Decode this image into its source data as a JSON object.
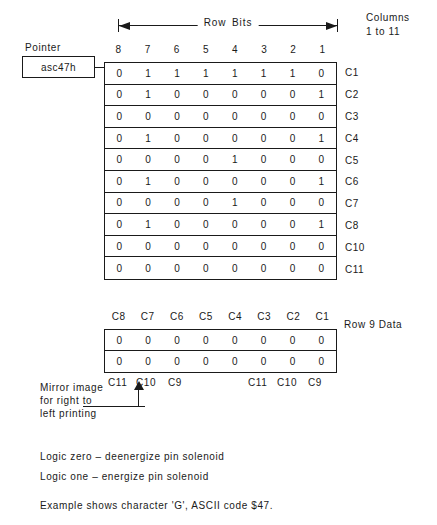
{
  "header": {
    "row_bits_label": "Row Bits",
    "columns_note_line1": "Columns",
    "columns_note_line2": "1  to  11"
  },
  "pointer": {
    "label": "Pointer",
    "value": "asc47h"
  },
  "main_table": {
    "column_headers": [
      "8",
      "7",
      "6",
      "5",
      "4",
      "3",
      "2",
      "1"
    ],
    "row_labels": [
      "C1",
      "C2",
      "C3",
      "C4",
      "C5",
      "C6",
      "C7",
      "C8",
      "C10",
      "C11"
    ],
    "rows": [
      [
        "0",
        "1",
        "1",
        "1",
        "1",
        "1",
        "1",
        "0"
      ],
      [
        "0",
        "1",
        "0",
        "0",
        "0",
        "0",
        "0",
        "1"
      ],
      [
        "0",
        "0",
        "0",
        "0",
        "0",
        "0",
        "0",
        "0"
      ],
      [
        "0",
        "1",
        "0",
        "0",
        "0",
        "0",
        "0",
        "1"
      ],
      [
        "0",
        "0",
        "0",
        "0",
        "1",
        "0",
        "0",
        "0"
      ],
      [
        "0",
        "1",
        "0",
        "0",
        "0",
        "0",
        "0",
        "1"
      ],
      [
        "0",
        "0",
        "0",
        "0",
        "1",
        "0",
        "0",
        "0"
      ],
      [
        "0",
        "1",
        "0",
        "0",
        "0",
        "0",
        "0",
        "1"
      ],
      [
        "0",
        "0",
        "0",
        "0",
        "0",
        "0",
        "0",
        "0"
      ],
      [
        "0",
        "0",
        "0",
        "0",
        "0",
        "0",
        "0",
        "0"
      ]
    ]
  },
  "row9_table": {
    "column_headers": [
      "C8",
      "C7",
      "C6",
      "C5",
      "C4",
      "C3",
      "C2",
      "C1"
    ],
    "rows": [
      [
        "0",
        "0",
        "0",
        "0",
        "0",
        "0",
        "0",
        "0"
      ],
      [
        "0",
        "0",
        "0",
        "0",
        "0",
        "0",
        "0",
        "0"
      ]
    ],
    "side_label": "Row  9  Data",
    "footer_left": [
      "C11",
      "C10",
      "C9"
    ],
    "footer_right": [
      "C11",
      "C10",
      "C9"
    ]
  },
  "mirror_note": {
    "line1": "Mirror  image",
    "line2": "for  right  to",
    "line3": "left  printing"
  },
  "legend": {
    "zero": "Logic zero  –    deenergize  pin  solenoid",
    "one": "Logic one  –    energize  pin  solenoid"
  },
  "example": {
    "text": "Example  shows  character  'G',  ASCII  code  $47."
  }
}
